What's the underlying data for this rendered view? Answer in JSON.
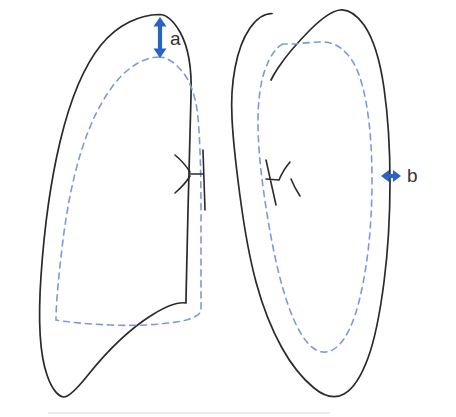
{
  "figure": {
    "background_color": "#ffffff",
    "width": 456,
    "height": 417
  },
  "annotations": {
    "apical_measure": {
      "label": "a",
      "label_x": 170,
      "label_y": 40,
      "arrow_color": "#2a63c4",
      "orientation": "vertical",
      "x": 160,
      "y_top": 17,
      "y_bottom": 58
    },
    "lateral_measure": {
      "label": "b",
      "label_x": 407,
      "label_y": 177,
      "arrow_color": "#2a63c4",
      "orientation": "horizontal",
      "y": 176,
      "x_left": 381,
      "x_right": 401
    }
  },
  "structures": {
    "left_pleura": {
      "name": "right-lung-chest-wall-outline",
      "stroke": "#2a2a2e"
    },
    "left_collapsed_edge": {
      "name": "right-lung-collapsed-edge",
      "stroke": "#7e99d9",
      "style": "dashed"
    },
    "right_pleura": {
      "name": "left-lung-chest-wall-outline",
      "stroke": "#2a2a2e"
    },
    "right_collapsed_edge": {
      "name": "left-lung-collapsed-edge",
      "stroke": "#7e99d9",
      "style": "dashed"
    },
    "left_hilum": {
      "name": "right-hilum-bronchus"
    },
    "right_hilum": {
      "name": "left-hilum-bronchus"
    }
  },
  "paths": {
    "left_pleura_outline": "M159.5,14.5 C140,14.8 118,24 101,45 C84,66 70,100 60,142 C50,184 44,232 41,276 C38,320 40,355 47,375 C52,390 59,397 64,397 C69,397 76,390 88,375 C104,355 128,330 152,315 C168,305 180,302 186,303 L186,299 C186,290 187,250 188,210 C189,170 190,130 191,96 C192,70 189,48 180,32 C173,20 167,14.5 159.5,14.5 Z",
    "left_dashed_edge": "M159,57 C146,57 130,65 116,82 C102,99 90,123 81,152 C72,181 66,214 62,248 C58,282 56,306 56,320 C66,322 86,324 110,325 C134,326 158,325 176,322 C190,320 199,316 201,311 C201,290 201,250 201,210 C201,172 200,140 198,118 C196,96 190,80 181,70 C173,61 166,57 159,57 Z",
    "right_pleura_outline": "M272,13.5 C264,13.5 257,18 250,28 C243,38 238,52 235,68 C232,84 231,100 232,118 C233,140 236,166 240,196 C244,226 249,256 256,282 C263,308 272,330 282,348 C292,366 303,379 314,388 C325,397 335,399 344,394 C353,389 361,377 368,358 C375,339 380,313 384,282 C388,251 390,216 390,182 C390,148 388,116 384,88 C380,60 373,38 364,25 C356,14 348,9 340,10 C332,11 322,18 310,30 C298,42 286,56 278,68 C274,74 272,78 271,80",
    "right_dashed_edge": "M283,44 C276,47 270,56 265,70 C260,84 258,102 258,122 C258,142 260,166 264,194 C268,222 273,250 279,274 C285,298 292,318 300,332 C308,346 317,353 326,352 C335,351 343,343 350,328 C357,313 362,292 366,266 C370,240 372,210 372,180 C372,150 370,124 366,102 C362,80 356,64 348,55 C340,46 332,42 323,42 C314,42 303,43 295,44 Z",
    "left_hilum": "M175,155 C182,161 187,167 190,172 M175,193 C182,187 187,181 190,176 M190,174 L203,174 M203,150 L205,210",
    "right_hilum": "M290,162 C285,168 281,175 279,180 M300,196 C296,190 293,184 291,179 M279,180 L266,179 M266,160 L276,205"
  }
}
